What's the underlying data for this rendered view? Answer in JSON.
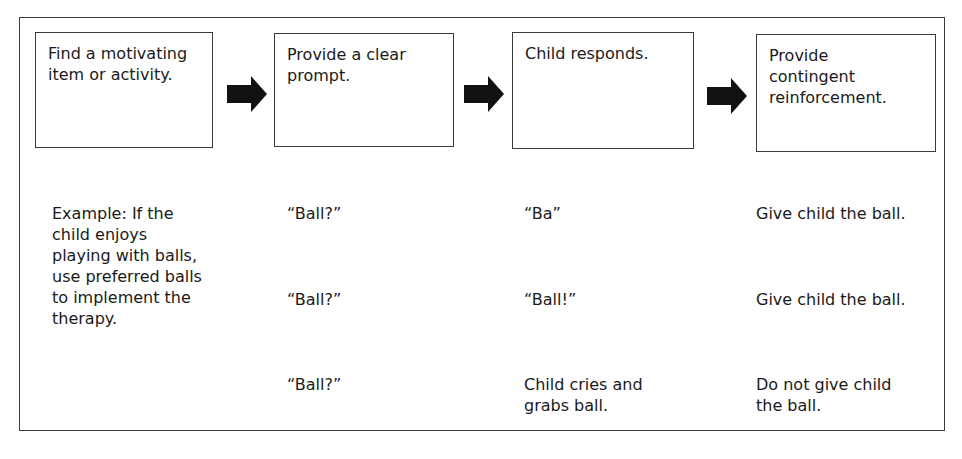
{
  "steps": [
    {
      "label": "Find a motivating\nitem or activity."
    },
    {
      "label": "Provide a clear\nprompt."
    },
    {
      "label": "Child responds."
    },
    {
      "label": "Provide\ncontingent\nreinforcement."
    }
  ],
  "arrows": [
    {
      "icon": "right-arrow-icon"
    },
    {
      "icon": "right-arrow-icon"
    },
    {
      "icon": "right-arrow-icon"
    }
  ],
  "example": {
    "description": "Example: If the\nchild enjoys\nplaying with balls,\nuse preferred balls\nto implement the\ntherapy.",
    "rows": [
      {
        "prompt": "“Ball?”",
        "response": "“Ba”",
        "reinforcement": "Give child the ball."
      },
      {
        "prompt": "“Ball?”",
        "response": "“Ball!”",
        "reinforcement": "Give child the ball."
      },
      {
        "prompt": "“Ball?”",
        "response": "Child cries and\ngrabs ball.",
        "reinforcement": "Do not give child\nthe ball."
      }
    ]
  },
  "colors": {
    "border": "#3a3a3a",
    "arrow": "#111111",
    "text": "#1a1a1a"
  }
}
